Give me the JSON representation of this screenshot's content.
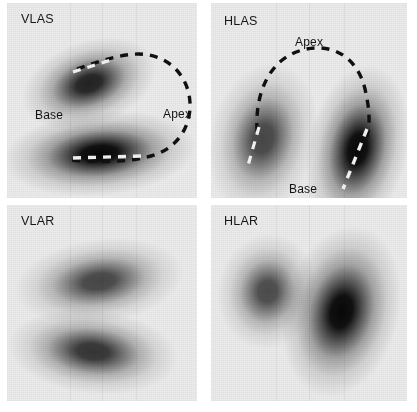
{
  "figure": {
    "background_color": "#ffffff",
    "panel_base_color": "#ececec",
    "ink_color": "#101010",
    "contour_dark_color": "#101010",
    "contour_light_color": "#f4f4f4",
    "width": 417,
    "height": 412,
    "modality": "SPECT myocardial perfusion scintigraphy",
    "panel_count": 4
  },
  "panels": [
    {
      "id": "vlas",
      "label": "VLAS",
      "label_long": "Vertical Long Axis Stress",
      "position": {
        "x": 7,
        "y": 3,
        "width": 190,
        "height": 195
      },
      "row": "stress",
      "orientation": "vertical-long-axis",
      "label_pos": {
        "x": 14,
        "y": 10
      },
      "annotations": [
        {
          "name": "base",
          "text": "Base",
          "x": 28,
          "y": 106
        },
        {
          "name": "apex",
          "text": "Apex",
          "x": 156,
          "y": 105
        }
      ],
      "contour": {
        "shape": "horseshoe-open-left",
        "dash": "8 7",
        "stroke_width": 3.4,
        "path": "M 70 66 C 96 57, 122 48, 142 52 C 168 57, 182 78, 183 100 C 184 124, 170 146, 144 153 C 118 160, 92 159, 62 157",
        "highlight_segments": [
          {
            "name": "apical-anterior-marker",
            "path": "M 66 69 L 104 57",
            "stroke_width": 3.2
          },
          {
            "name": "inferior-wall-marker",
            "path": "M 66 155 L 136 153",
            "stroke_width": 3.4
          }
        ]
      },
      "uptake_regions": [
        {
          "name": "anterior-wall",
          "cx": 82,
          "cy": 80,
          "rx": 36,
          "ry": 22,
          "intensity": 0.88,
          "rotation": -20
        },
        {
          "name": "inferior-wall",
          "cx": 92,
          "cy": 150,
          "rx": 50,
          "ry": 22,
          "intensity": 1.0,
          "rotation": -5
        }
      ]
    },
    {
      "id": "hlas",
      "label": "HLAS",
      "label_long": "Horizontal Long Axis Stress",
      "position": {
        "x": 211,
        "y": 3,
        "width": 196,
        "height": 195
      },
      "row": "stress",
      "orientation": "horizontal-long-axis",
      "label_pos": {
        "x": 13,
        "y": 12
      },
      "annotations": [
        {
          "name": "apex",
          "text": "Apex",
          "x": 84,
          "y": 33
        },
        {
          "name": "base",
          "text": "Base",
          "x": 78,
          "y": 180
        }
      ],
      "contour": {
        "shape": "inverted-u-open-down",
        "dash": "8 7",
        "stroke_width": 3.4,
        "path": "M 46 128 C 44 90, 58 58, 88 48 C 118 38, 146 52, 154 86 C 159 108, 159 120, 156 134",
        "highlight_segments": [
          {
            "name": "septal-wall-marker",
            "path": "M 48 124 L 36 166",
            "stroke_width": 3.2
          },
          {
            "name": "lateral-wall-marker",
            "path": "M 156 126 L 132 186",
            "stroke_width": 3.4
          }
        ]
      },
      "uptake_regions": [
        {
          "name": "septal-wall",
          "cx": 52,
          "cy": 136,
          "rx": 28,
          "ry": 40,
          "intensity": 0.72,
          "rotation": 14
        },
        {
          "name": "lateral-wall",
          "cx": 146,
          "cy": 146,
          "rx": 26,
          "ry": 44,
          "intensity": 1.0,
          "rotation": 12
        }
      ]
    },
    {
      "id": "vlar",
      "label": "VLAR",
      "label_long": "Vertical Long Axis Rest",
      "position": {
        "x": 7,
        "y": 205,
        "width": 190,
        "height": 196
      },
      "row": "rest",
      "orientation": "vertical-long-axis",
      "label_pos": {
        "x": 14,
        "y": 10
      },
      "annotations": [],
      "contour": null,
      "uptake_regions": [
        {
          "name": "anterior-wall",
          "cx": 92,
          "cy": 76,
          "rx": 44,
          "ry": 22,
          "intensity": 0.72,
          "rotation": -8
        },
        {
          "name": "inferior-wall",
          "cx": 86,
          "cy": 146,
          "rx": 44,
          "ry": 22,
          "intensity": 0.8,
          "rotation": 6
        }
      ]
    },
    {
      "id": "hlar",
      "label": "HLAR",
      "label_long": "Horizontal Long Axis Rest",
      "position": {
        "x": 211,
        "y": 205,
        "width": 196,
        "height": 196
      },
      "row": "rest",
      "orientation": "horizontal-long-axis",
      "label_pos": {
        "x": 13,
        "y": 10
      },
      "annotations": [],
      "contour": null,
      "uptake_regions": [
        {
          "name": "septal-wall",
          "cx": 56,
          "cy": 86,
          "rx": 26,
          "ry": 30,
          "intensity": 0.7,
          "rotation": 10
        },
        {
          "name": "lateral-wall",
          "cx": 130,
          "cy": 106,
          "rx": 30,
          "ry": 45,
          "intensity": 1.0,
          "rotation": 14
        }
      ]
    }
  ]
}
